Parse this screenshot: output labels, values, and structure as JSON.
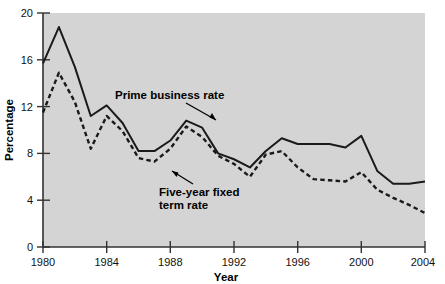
{
  "chart_data": {
    "type": "line",
    "title": "",
    "xlabel": "Year",
    "ylabel": "Percentage",
    "xlim": [
      1980,
      2004
    ],
    "ylim": [
      0,
      20
    ],
    "xticks": [
      1980,
      1984,
      1988,
      1992,
      1996,
      2000,
      2004
    ],
    "yticks": [
      0,
      4,
      8,
      12,
      16,
      20
    ],
    "grid": false,
    "legend_position": "inline-annotations",
    "plot_background": "#d4d4d4",
    "line_color": "#1a1a1a",
    "x": [
      1980,
      1981,
      1982,
      1983,
      1984,
      1985,
      1986,
      1987,
      1988,
      1989,
      1990,
      1991,
      1992,
      1993,
      1994,
      1995,
      1996,
      1997,
      1998,
      1999,
      2000,
      2001,
      2002,
      2003,
      2004
    ],
    "series": [
      {
        "name": "Prime business rate",
        "style": "solid",
        "values": [
          15.7,
          18.8,
          15.4,
          11.2,
          12.1,
          10.6,
          10.5,
          9.5,
          10.8,
          13.3,
          14.1,
          9.9,
          7.4,
          6.1,
          7.4,
          8.7,
          6.1,
          4.9,
          6.6,
          6.4,
          7.3,
          5.8,
          4.2,
          4.7,
          4.0
        ],
        "pixel_values": [
          15.7,
          18.8,
          15.4,
          11.2,
          12.1,
          10.6,
          8.2,
          8.2,
          9.1,
          10.8,
          10.2,
          8.0,
          7.5,
          6.8,
          8.2,
          9.3,
          8.8,
          8.8,
          8.8,
          8.5,
          9.5,
          6.5,
          5.4,
          5.4,
          5.6
        ]
      },
      {
        "name": "Five-year fixed term rate",
        "style": "dashed",
        "values": [
          11.5,
          14.9,
          12.4,
          8.4,
          11.2,
          9.9,
          7.6,
          7.3,
          8.4,
          10.3,
          9.4,
          7.8,
          7.1,
          6.0,
          7.9,
          8.2,
          6.8,
          5.8,
          5.7,
          5.6,
          6.4,
          4.9,
          4.2,
          3.6,
          2.9
        ]
      }
    ],
    "annotations": [
      {
        "text": "Prime business rate",
        "at_x": 1985.2,
        "at_y": 12.6
      },
      {
        "text": "Five-year fixed",
        "at_x": 1986.6,
        "at_y": 4.9
      },
      {
        "text": "term rate",
        "at_x": 1986.6,
        "at_y": 3.9
      }
    ]
  },
  "axis": {
    "y_label": "Percentage",
    "x_label": "Year",
    "y_ticks": [
      "20",
      "16",
      "12",
      "8",
      "4",
      "0"
    ],
    "x_ticks": [
      "1980",
      "1984",
      "1988",
      "1992",
      "1996",
      "2000",
      "2004"
    ]
  },
  "labels": {
    "prime": "Prime business rate",
    "fixed_line1": "Five-year fixed",
    "fixed_line2": "term rate"
  }
}
